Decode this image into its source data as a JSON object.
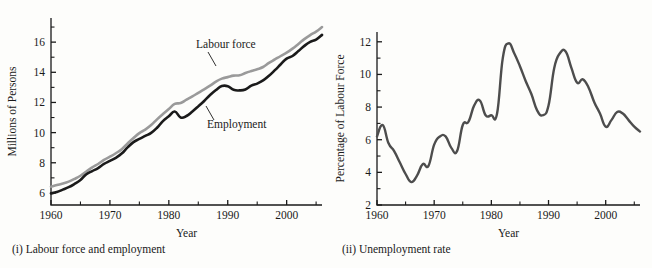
{
  "figure": {
    "panels": [
      {
        "id": "labour-force-and-employment",
        "caption": "(i) Labour force and employment"
      },
      {
        "id": "unemployment-rate",
        "caption": "(ii) Unemployment rate"
      }
    ]
  },
  "chart_data": [
    {
      "type": "line",
      "title": "",
      "panel_label": "(i) Labour force and employment",
      "xlabel": "Year",
      "ylabel": "Millions of Persons",
      "xlim": [
        1960,
        2006
      ],
      "ylim": [
        5.2,
        17.6
      ],
      "xticks": [
        1960,
        1970,
        1980,
        1990,
        2000
      ],
      "xticklabels": [
        "1960",
        "1970",
        "1980",
        "1990",
        "2000"
      ],
      "xminorticks": [
        1965,
        1975,
        1985,
        1995,
        2005
      ],
      "yticks": [
        6,
        8,
        10,
        12,
        14,
        16
      ],
      "yticklabels": [
        "6",
        "8",
        "10",
        "12",
        "14",
        "16"
      ],
      "yminorticks": [
        7,
        9,
        11,
        13,
        15,
        17
      ],
      "grid": false,
      "legend": "annotations-on-plot",
      "annotations": [
        {
          "text": "Labour force",
          "series": "Labour force"
        },
        {
          "text": "Employment",
          "series": "Employment"
        }
      ],
      "x": [
        1960,
        1961,
        1962,
        1963,
        1964,
        1965,
        1966,
        1967,
        1968,
        1969,
        1970,
        1971,
        1972,
        1973,
        1974,
        1975,
        1976,
        1977,
        1978,
        1979,
        1980,
        1981,
        1982,
        1983,
        1984,
        1985,
        1986,
        1987,
        1988,
        1989,
        1990,
        1991,
        1992,
        1993,
        1994,
        1995,
        1996,
        1997,
        1998,
        1999,
        2000,
        2001,
        2002,
        2003,
        2004,
        2005,
        2006
      ],
      "series": [
        {
          "name": "Labour force",
          "color": "#9a9a9a",
          "values": [
            6.41,
            6.52,
            6.62,
            6.75,
            6.93,
            7.14,
            7.42,
            7.69,
            7.92,
            8.19,
            8.4,
            8.63,
            8.9,
            9.28,
            9.64,
            9.97,
            10.2,
            10.5,
            10.88,
            11.23,
            11.57,
            11.9,
            11.96,
            12.18,
            12.4,
            12.64,
            12.87,
            13.11,
            13.38,
            13.58,
            13.68,
            13.78,
            13.8,
            13.95,
            14.08,
            14.2,
            14.35,
            14.62,
            14.85,
            15.08,
            15.3,
            15.57,
            15.88,
            16.2,
            16.47,
            16.7,
            17.0
          ]
        },
        {
          "name": "Employment",
          "color": "#1a1a1a",
          "values": [
            5.97,
            6.06,
            6.22,
            6.38,
            6.6,
            6.86,
            7.24,
            7.45,
            7.65,
            7.92,
            8.12,
            8.33,
            8.61,
            9.02,
            9.37,
            9.58,
            9.78,
            9.98,
            10.32,
            10.76,
            11.08,
            11.4,
            11.0,
            11.1,
            11.4,
            11.74,
            12.1,
            12.49,
            12.82,
            13.09,
            13.08,
            12.84,
            12.8,
            12.86,
            13.11,
            13.25,
            13.46,
            13.77,
            14.14,
            14.53,
            14.91,
            15.08,
            15.41,
            15.75,
            16.02,
            16.17,
            16.48
          ]
        }
      ]
    },
    {
      "type": "line",
      "title": "",
      "panel_label": "(ii) Unemployment rate",
      "xlabel": "Year",
      "ylabel": "Percentage of Labour Force",
      "xlim": [
        1960,
        2006
      ],
      "ylim": [
        2,
        12.6
      ],
      "xticks": [
        1960,
        1970,
        1980,
        1990,
        2000
      ],
      "xticklabels": [
        "1960",
        "1970",
        "1980",
        "1990",
        "2000"
      ],
      "xminorticks": [
        1965,
        1975,
        1985,
        1995,
        2005
      ],
      "yticks": [
        2,
        4,
        6,
        8,
        10,
        12
      ],
      "yticklabels": [
        "2",
        "4",
        "6",
        "8",
        "10",
        "12"
      ],
      "yminorticks": [
        3,
        5,
        7,
        9,
        11
      ],
      "grid": false,
      "legend": "none",
      "x": [
        1960,
        1961,
        1962,
        1963,
        1964,
        1965,
        1966,
        1967,
        1968,
        1969,
        1970,
        1971,
        1972,
        1973,
        1974,
        1975,
        1976,
        1977,
        1978,
        1979,
        1980,
        1981,
        1982,
        1983,
        1984,
        1985,
        1986,
        1987,
        1988,
        1989,
        1990,
        1991,
        1992,
        1993,
        1994,
        1995,
        1996,
        1997,
        1998,
        1999,
        2000,
        2001,
        2002,
        2003,
        2004,
        2005,
        2006
      ],
      "series": [
        {
          "name": "Unemployment rate",
          "color": "#4d4d4d",
          "values": [
            6.2,
            6.9,
            5.8,
            5.3,
            4.6,
            3.9,
            3.4,
            3.8,
            4.5,
            4.4,
            5.7,
            6.2,
            6.2,
            5.5,
            5.3,
            6.9,
            7.1,
            8.1,
            8.4,
            7.5,
            7.5,
            7.6,
            11.0,
            11.9,
            11.3,
            10.5,
            9.6,
            8.8,
            7.8,
            7.5,
            8.1,
            10.4,
            11.3,
            11.4,
            10.4,
            9.5,
            9.7,
            9.2,
            8.3,
            7.6,
            6.8,
            7.2,
            7.7,
            7.6,
            7.2,
            6.8,
            6.5
          ]
        }
      ]
    }
  ]
}
